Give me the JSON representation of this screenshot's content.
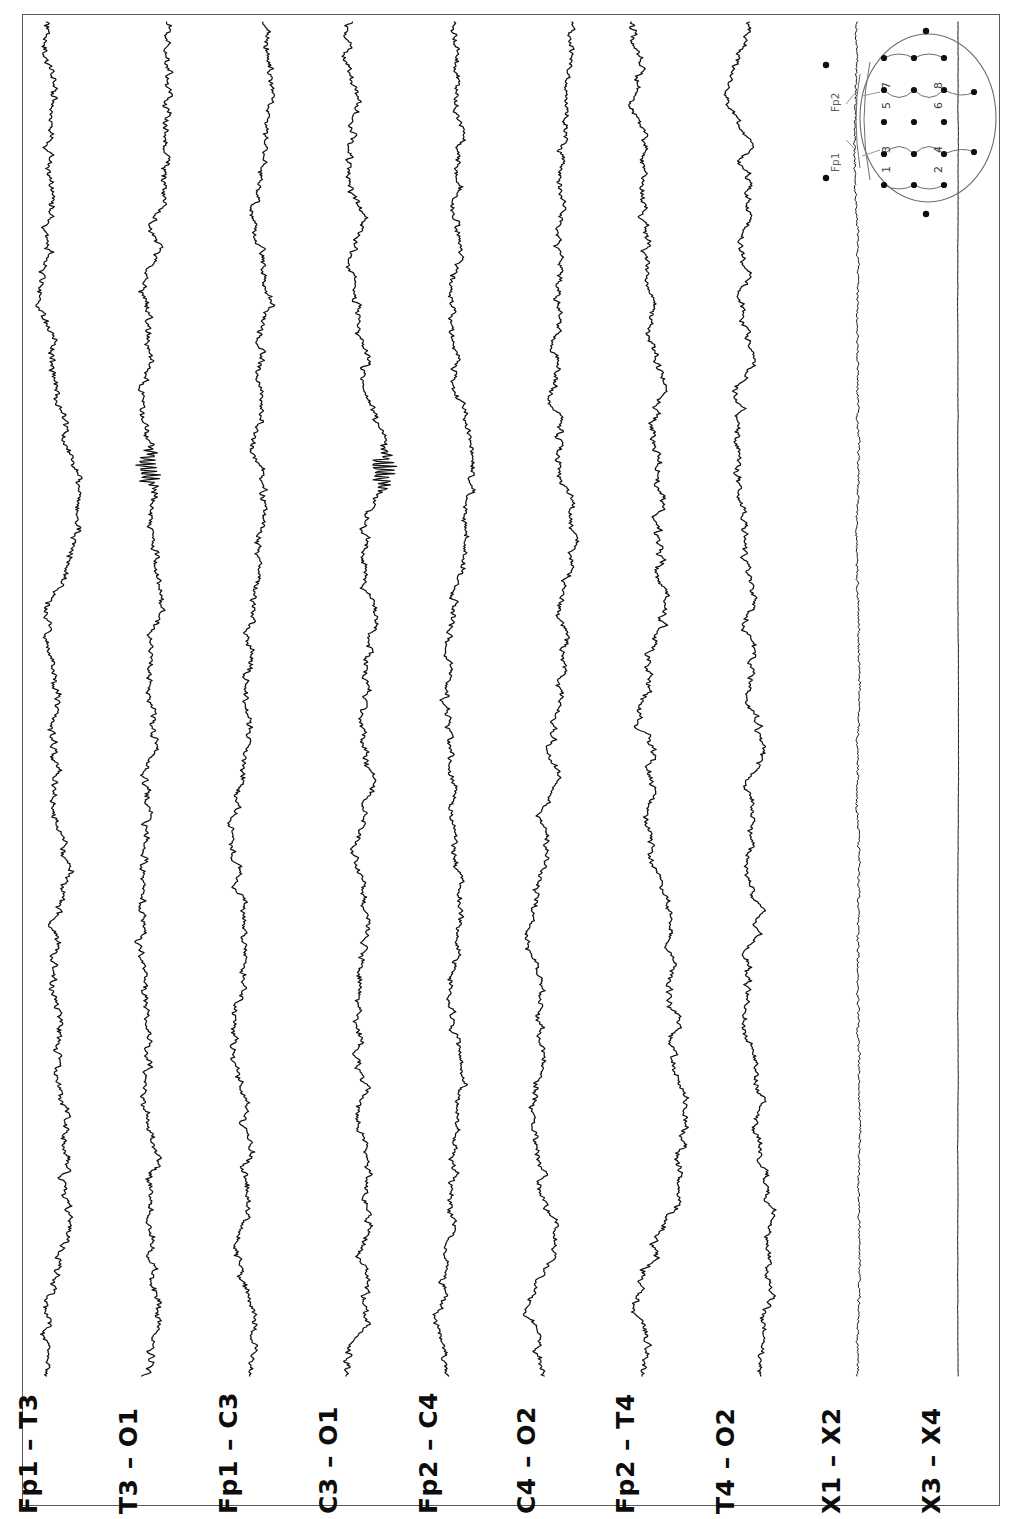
{
  "document": {
    "kind": "eeg-recording-chart",
    "orientation": "landscape-rotated-90",
    "background_color": "#ffffff",
    "trace_color": "#111111",
    "frame_color": "#5a5a5a"
  },
  "channels": [
    {
      "label": "Fp1 – T3",
      "baseline_x": 55,
      "amplitude": 16,
      "noise": 3.4,
      "burst": null
    },
    {
      "label": "T3 – O1",
      "baseline_x": 155,
      "amplitude": 18,
      "noise": 2.8,
      "burst": 470
    },
    {
      "label": "Fp1 – C3",
      "baseline_x": 255,
      "amplitude": 15,
      "noise": 3.0,
      "burst": null
    },
    {
      "label": "C3 – O1",
      "baseline_x": 355,
      "amplitude": 19,
      "noise": 2.6,
      "burst": 470
    },
    {
      "label": "Fp2 – C4",
      "baseline_x": 455,
      "amplitude": 16,
      "noise": 2.6,
      "burst": null
    },
    {
      "label": "C4 – O2",
      "baseline_x": 553,
      "amplitude": 18,
      "noise": 2.4,
      "burst": null
    },
    {
      "label": "Fp2 – T4",
      "baseline_x": 652,
      "amplitude": 20,
      "noise": 2.6,
      "burst": null
    },
    {
      "label": "T4 – O2",
      "baseline_x": 752,
      "amplitude": 19,
      "noise": 2.2,
      "burst": null
    },
    {
      "label": "X1 – X2",
      "baseline_x": 858,
      "amplitude": 2.2,
      "noise": 1.6,
      "burst": null
    },
    {
      "label": "X3 – X4",
      "baseline_x": 958,
      "amplitude": 0.5,
      "noise": 0.18,
      "burst": null
    }
  ],
  "head_map": {
    "title_electrodes": [
      "Fp1",
      "Fp2"
    ],
    "derivation_numbers": [
      "1",
      "3",
      "5",
      "7",
      "2",
      "4",
      "6",
      "8"
    ],
    "circle": {
      "cx": 928,
      "cy": 118,
      "rx": 68,
      "ry": 84
    },
    "lead_labels": [
      {
        "text": "Fp1",
        "x": 841,
        "y": 160
      },
      {
        "text": "Fp2",
        "x": 841,
        "y": 100
      }
    ],
    "numbers": [
      {
        "text": "1",
        "x": 893,
        "y": 160
      },
      {
        "text": "3",
        "x": 893,
        "y": 140
      },
      {
        "text": "5",
        "x": 893,
        "y": 96
      },
      {
        "text": "7",
        "x": 893,
        "y": 76
      },
      {
        "text": "2",
        "x": 945,
        "y": 160
      },
      {
        "text": "4",
        "x": 945,
        "y": 140
      },
      {
        "text": "6",
        "x": 945,
        "y": 96
      },
      {
        "text": "8",
        "x": 945,
        "y": 76
      }
    ],
    "electrodes": [
      {
        "x": 884,
        "y": 58
      },
      {
        "x": 914,
        "y": 58
      },
      {
        "x": 944,
        "y": 58
      },
      {
        "x": 884,
        "y": 90
      },
      {
        "x": 914,
        "y": 90
      },
      {
        "x": 944,
        "y": 90
      },
      {
        "x": 974,
        "y": 92
      },
      {
        "x": 884,
        "y": 122
      },
      {
        "x": 914,
        "y": 122
      },
      {
        "x": 944,
        "y": 122
      },
      {
        "x": 884,
        "y": 154
      },
      {
        "x": 914,
        "y": 154
      },
      {
        "x": 944,
        "y": 154
      },
      {
        "x": 974,
        "y": 152
      },
      {
        "x": 884,
        "y": 185
      },
      {
        "x": 914,
        "y": 185
      },
      {
        "x": 944,
        "y": 185
      }
    ],
    "outer_markers": [
      {
        "x": 826,
        "y": 65
      },
      {
        "x": 826,
        "y": 178
      },
      {
        "x": 926,
        "y": 31
      },
      {
        "x": 926,
        "y": 214
      }
    ]
  },
  "trace_area": {
    "x": 24,
    "y": 16,
    "width": 974,
    "height": 1356,
    "top": 22,
    "bottom": 1376
  }
}
